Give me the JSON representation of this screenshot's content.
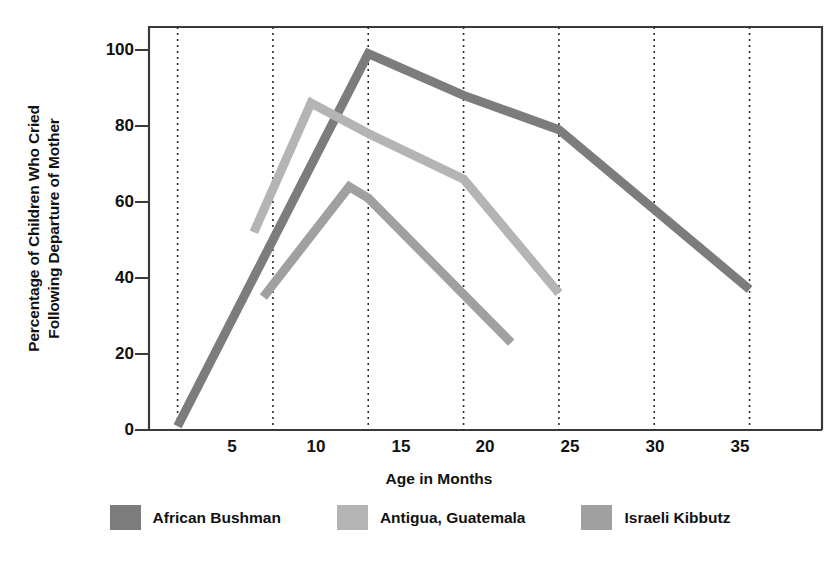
{
  "chart_data": {
    "type": "line",
    "title": "",
    "xlabel": "Age in Months",
    "ylabel_line1": "Percentage of Children Who Cried",
    "ylabel_line2": "Following Departure of Mother",
    "xlim": [
      3.5,
      38.8
    ],
    "ylim": [
      0,
      106
    ],
    "xticks": [
      5,
      10,
      15,
      20,
      25,
      30,
      35
    ],
    "yticks": [
      0,
      20,
      40,
      60,
      80,
      100
    ],
    "grid": "vertical dotted gridlines at each x tick",
    "legend_position": "below plot, horizontal",
    "series": [
      {
        "name": "African Bushman",
        "color": "#7c7c7c",
        "x": [
          5,
          15,
          20,
          25,
          35
        ],
        "y": [
          1,
          99,
          88,
          79,
          37
        ]
      },
      {
        "name": "Antigua, Guatemala",
        "color": "#b4b4b4",
        "x": [
          9,
          12,
          15,
          20,
          25
        ],
        "y": [
          52,
          86,
          78,
          66,
          36
        ]
      },
      {
        "name": "Israeli Kibbutz",
        "color": "#a0a0a0",
        "x": [
          9.5,
          14,
          15,
          22.5
        ],
        "y": [
          35,
          64,
          61,
          23
        ]
      }
    ]
  },
  "legend": {
    "items": [
      {
        "label": "African Bushman",
        "color": "#7c7c7c"
      },
      {
        "label": "Antigua, Guatemala",
        "color": "#b4b4b4"
      },
      {
        "label": "Israeli Kibbutz",
        "color": "#a0a0a0"
      }
    ]
  },
  "axes": {
    "frame_color": "#3a3a3a",
    "gridline_color": "#2b2b2b"
  }
}
